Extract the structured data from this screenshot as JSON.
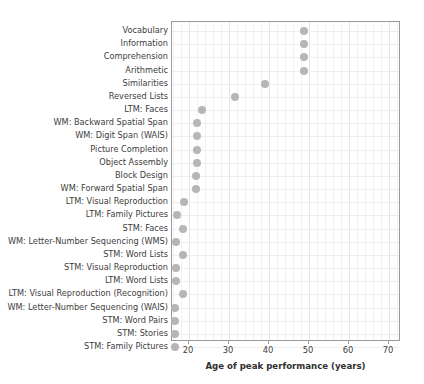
{
  "chart_data": {
    "type": "scatter",
    "title": "",
    "xlabel": "Age of peak performance (years)",
    "ylabel": "",
    "xlim": [
      15.75,
      73.0
    ],
    "xticks": [
      20,
      30,
      40,
      50,
      60,
      70
    ],
    "xtick_labels": [
      "20",
      "30",
      "40",
      "50",
      "60",
      "70"
    ],
    "grid": true,
    "legend": null,
    "orientation": "horizontal",
    "marker": {
      "shape": "circle",
      "color": "#b6b6b6",
      "size": 8
    },
    "categories": [
      "Vocabulary",
      "Information",
      "Comprehension",
      "Arithmetic",
      "Similarities",
      "Reversed Lists",
      "LTM: Faces",
      "WM: Backward Spatial Span",
      "WM: Digit Span (WAIS)",
      "Picture Completion",
      "Object Assembly",
      "Block Design",
      "WM: Forward Spatial Span",
      "LTM: Visual Reproduction",
      "LTM: Family Pictures",
      "STM: Faces",
      "WM: Letter-Number Sequencing (WMS)",
      "STM: Word Lists",
      "STM: Visual Reproduction",
      "LTM: Word Lists",
      "LTM: Visual Reproduction (Recognition)",
      "WM: Letter-Number Sequencing (WAIS)",
      "STM: Word Pairs",
      "STM: Stories",
      "STM: Family Pictures"
    ],
    "values": [
      48.8,
      48.8,
      48.8,
      48.8,
      39.0,
      31.5,
      23.2,
      22.0,
      22.0,
      22.0,
      22.0,
      21.8,
      21.8,
      18.8,
      17.0,
      18.6,
      16.8,
      18.6,
      16.8,
      16.8,
      18.4,
      16.6,
      16.6,
      16.6,
      16.6
    ]
  }
}
